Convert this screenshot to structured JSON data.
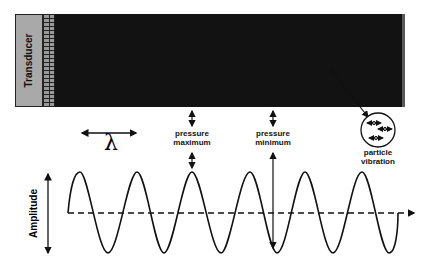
{
  "diagram": {
    "transducer_label": "Transducer",
    "wavelength_symbol": "λ",
    "pressure_max_label_line1": "pressure",
    "pressure_max_label_line2": "maximum",
    "pressure_min_label_line1": "pressure",
    "pressure_min_label_line2": "minimum",
    "particle_label_line1": "particle",
    "particle_label_line2": "vibration",
    "amplitude_label": "Amplitude"
  },
  "colors": {
    "transducer_fill": "#a9a9a9",
    "band_light": "#6e6e6e",
    "band_dark": "#141414",
    "line": "#111111"
  }
}
